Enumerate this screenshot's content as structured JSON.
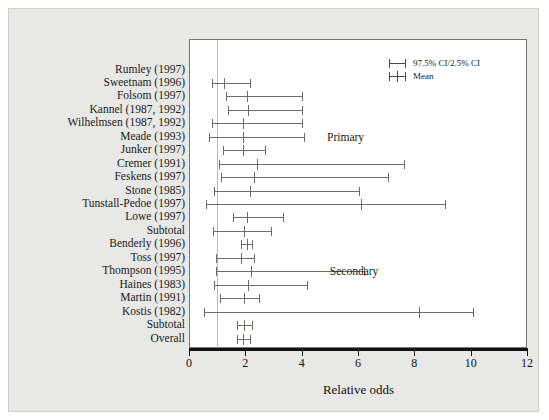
{
  "chart_data": {
    "type": "forest",
    "title": "",
    "xlabel": "Relative odds",
    "ylabel": "",
    "xlim": [
      0,
      12
    ],
    "xticks": [
      0,
      2,
      4,
      6,
      8,
      10,
      12
    ],
    "reference_line": 1,
    "grid": false,
    "legend": {
      "position": "top-right",
      "entries": [
        {
          "symbol": "interval-bar",
          "label": "97.5% CI/2.5% CI"
        },
        {
          "symbol": "interval-bar-with-mean",
          "label": "Mean"
        }
      ]
    },
    "group_labels": [
      {
        "text": "Primary",
        "x": 4.9,
        "row": 5
      },
      {
        "text": "Secondary",
        "x": 5.0,
        "row": 15
      }
    ],
    "rows": [
      {
        "label": "Rumley (1997)",
        "mean": null,
        "low": null,
        "high": null
      },
      {
        "label": "Sweetnam (1996)",
        "mean": 1.25,
        "low": 0.8,
        "high": 2.15
      },
      {
        "label": "Folsom (1997)",
        "mean": 2.05,
        "low": 1.3,
        "high": 4.0
      },
      {
        "label": "Kannel (1987, 1992)",
        "mean": 2.1,
        "low": 1.4,
        "high": 4.0
      },
      {
        "label": "Wilhelmsen (1987, 1992)",
        "mean": 1.9,
        "low": 0.8,
        "high": 4.0
      },
      {
        "label": "Meade (1993)",
        "mean": 1.9,
        "low": 0.7,
        "high": 4.1
      },
      {
        "label": "Junker (1997)",
        "mean": 1.9,
        "low": 1.2,
        "high": 2.7
      },
      {
        "label": "Cremer (1991)",
        "mean": 2.4,
        "low": 1.05,
        "high": 7.65
      },
      {
        "label": "Feskens (1997)",
        "mean": 2.3,
        "low": 1.15,
        "high": 7.05
      },
      {
        "label": "Stone (1985)",
        "mean": 2.15,
        "low": 0.9,
        "high": 6.05
      },
      {
        "label": "Tunstall-Pedoe (1997)",
        "mean": 6.1,
        "low": 0.6,
        "high": 9.1
      },
      {
        "label": "Lowe (1997)",
        "mean": 2.05,
        "low": 1.55,
        "high": 3.35
      },
      {
        "label": "Subtotal",
        "mean": 1.95,
        "low": 0.85,
        "high": 2.9
      },
      {
        "label": "Benderly (1996)",
        "mean": 2.05,
        "low": 1.85,
        "high": 2.25
      },
      {
        "label": "Toss (1997)",
        "mean": 1.85,
        "low": 0.95,
        "high": 2.3
      },
      {
        "label": "Thompson (1995)",
        "mean": 2.2,
        "low": 0.95,
        "high": 6.2
      },
      {
        "label": "Haines (1983)",
        "mean": 2.1,
        "low": 0.9,
        "high": 4.2
      },
      {
        "label": "Martin (1991)",
        "mean": 1.95,
        "low": 1.1,
        "high": 2.5
      },
      {
        "label": "Kostis (1982)",
        "mean": 8.15,
        "low": 0.55,
        "high": 10.1
      },
      {
        "label": "Subtotal",
        "mean": 1.95,
        "low": 1.7,
        "high": 2.25
      },
      {
        "label": "Overall",
        "mean": 1.92,
        "low": 1.7,
        "high": 2.15
      }
    ]
  },
  "axis": {
    "title": "Relative odds",
    "tick_labels": [
      "0",
      "2",
      "4",
      "6",
      "8",
      "10",
      "12"
    ]
  },
  "legend": {
    "ci_label": "97.5% CI/2.5% CI",
    "mean_label": "Mean"
  },
  "groups": {
    "primary": "Primary",
    "secondary": "Secondary"
  },
  "colors": {
    "background": "#e8e8e6",
    "plot_background": "#ffffff",
    "bar": "#6d6d68",
    "axis": "#121212",
    "reference_line": "#b9b9b4"
  }
}
